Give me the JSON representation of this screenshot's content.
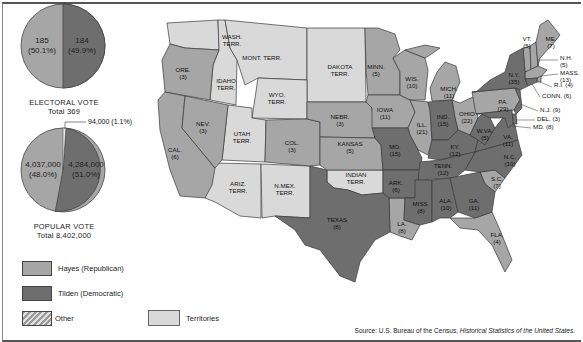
{
  "colors": {
    "hayes": "#a6a6a6",
    "tilden": "#6e6e6e",
    "territories": "#d9d9d9",
    "other": "#bdbdbd",
    "border": "#3a3a3a"
  },
  "electoral": {
    "hayes_value": "185",
    "hayes_pct": "(50.1%)",
    "tilden_value": "184",
    "tilden_pct": "(49.9%)",
    "title": "ELECTORAL VOTE",
    "total": "Total  369"
  },
  "popular": {
    "hayes_value": "4,037,000",
    "hayes_pct": "(48.0%)",
    "tilden_value": "4,284,000",
    "tilden_pct": "(51.0%)",
    "other_callout": "94,000 (1.1%)",
    "title": "POPULAR VOTE",
    "total": "Total  8,402,000"
  },
  "legend": {
    "hayes": "Hayes (Republican)",
    "tilden": "Tilden (Democratic)",
    "other": "Other",
    "territories": "Territories"
  },
  "source": {
    "prefix": "Source: U.S. Bureau of the Census, ",
    "title": "Historical Statistics of the United States."
  },
  "chart_data": [
    {
      "type": "pie",
      "title": "ELECTORAL VOTE",
      "subtitle": "Total 369",
      "categories": [
        "Hayes (Republican)",
        "Tilden (Democratic)"
      ],
      "values": [
        185,
        184
      ],
      "percentages": [
        50.1,
        49.9
      ]
    },
    {
      "type": "pie",
      "title": "POPULAR VOTE",
      "subtitle": "Total 8,402,000",
      "categories": [
        "Hayes (Republican)",
        "Tilden (Democratic)",
        "Other"
      ],
      "values": [
        4037000,
        4284000,
        94000
      ],
      "percentages": [
        48.0,
        51.0,
        1.1
      ]
    }
  ],
  "map": {
    "labels": [
      {
        "id": "wash",
        "line1": "WASH.",
        "line2": "TERR.",
        "x": 232,
        "y": 40
      },
      {
        "id": "mont",
        "line1": "MONT. TERR.",
        "line2": "",
        "x": 262,
        "y": 57
      },
      {
        "id": "dakota",
        "line1": "DAKOTA",
        "line2": "TERR.",
        "x": 340,
        "y": 70
      },
      {
        "id": "minn",
        "line1": "MINN.",
        "line2": "(5)",
        "x": 376,
        "y": 70
      },
      {
        "id": "ore",
        "line1": "ORE.",
        "line2": "(3)",
        "x": 183,
        "y": 73
      },
      {
        "id": "idaho",
        "line1": "IDAHO",
        "line2": "TERR.",
        "x": 226,
        "y": 84
      },
      {
        "id": "wyo",
        "line1": "WYO.",
        "line2": "TERR.",
        "x": 277,
        "y": 98
      },
      {
        "id": "wis",
        "line1": "WIS.",
        "line2": "(10)",
        "x": 412,
        "y": 82
      },
      {
        "id": "mich",
        "line1": "MICH.",
        "line2": "(11)",
        "x": 449,
        "y": 92
      },
      {
        "id": "iowa",
        "line1": "IOWA",
        "line2": "(11)",
        "x": 385,
        "y": 113
      },
      {
        "id": "nebr",
        "line1": "NEBR.",
        "line2": "(3)",
        "x": 340,
        "y": 120
      },
      {
        "id": "nev",
        "line1": "NEV.",
        "line2": "(3)",
        "x": 203,
        "y": 127
      },
      {
        "id": "ill",
        "line1": "ILL.",
        "line2": "(21)",
        "x": 422,
        "y": 128
      },
      {
        "id": "ind",
        "line1": "IND.",
        "line2": "(15)",
        "x": 443,
        "y": 120
      },
      {
        "id": "ohio",
        "line1": "OHIO",
        "line2": "(22)",
        "x": 467,
        "y": 117
      },
      {
        "id": "pa",
        "line1": "PA.",
        "line2": "(29)",
        "x": 503,
        "y": 105
      },
      {
        "id": "ny",
        "line1": "N.Y.",
        "line2": "(35)",
        "x": 514,
        "y": 78
      },
      {
        "id": "utah",
        "line1": "UTAH",
        "line2": "TERR.",
        "x": 242,
        "y": 137
      },
      {
        "id": "col",
        "line1": "COL.",
        "line2": "(3)",
        "x": 292,
        "y": 146
      },
      {
        "id": "kansas",
        "line1": "KANSAS",
        "line2": "(5)",
        "x": 350,
        "y": 147
      },
      {
        "id": "mo",
        "line1": "MO.",
        "line2": "(15)",
        "x": 395,
        "y": 150
      },
      {
        "id": "ky",
        "line1": "KY.",
        "line2": "(12)",
        "x": 455,
        "y": 150
      },
      {
        "id": "wva",
        "line1": "W.VA.",
        "line2": "(5)",
        "x": 485,
        "y": 134
      },
      {
        "id": "va",
        "line1": "VA.",
        "line2": "(11)",
        "x": 508,
        "y": 140
      },
      {
        "id": "cal",
        "line1": "CAL.",
        "line2": "(6)",
        "x": 175,
        "y": 153
      },
      {
        "id": "nc",
        "line1": "N.C.",
        "line2": "(10)",
        "x": 510,
        "y": 160
      },
      {
        "id": "tenn",
        "line1": "TENN.",
        "line2": "(12)",
        "x": 443,
        "y": 169
      },
      {
        "id": "indian",
        "line1": "INDIAN",
        "line2": "TERR.",
        "x": 356,
        "y": 178
      },
      {
        "id": "ark",
        "line1": "ARK.",
        "line2": "(6)",
        "x": 396,
        "y": 186
      },
      {
        "id": "sc",
        "line1": "S.C.",
        "line2": "(7)",
        "x": 497,
        "y": 182
      },
      {
        "id": "ariz",
        "line1": "ARIZ.",
        "line2": "TERR.",
        "x": 238,
        "y": 187
      },
      {
        "id": "nmex",
        "line1": "N.MEX.",
        "line2": "TERR.",
        "x": 285,
        "y": 189
      },
      {
        "id": "miss",
        "line1": "MISS.",
        "line2": "(8)",
        "x": 421,
        "y": 207
      },
      {
        "id": "ala",
        "line1": "ALA.",
        "line2": "(10)",
        "x": 446,
        "y": 204
      },
      {
        "id": "ga",
        "line1": "GA.",
        "line2": "(11)",
        "x": 474,
        "y": 204
      },
      {
        "id": "texas",
        "line1": "TEXAS",
        "line2": "(8)",
        "x": 337,
        "y": 223
      },
      {
        "id": "la",
        "line1": "LA.",
        "line2": "(8)",
        "x": 402,
        "y": 227
      },
      {
        "id": "fla",
        "line1": "FLA.",
        "line2": "(4)",
        "x": 497,
        "y": 238
      },
      {
        "id": "vt",
        "line1": "VT.",
        "line2": "(5)",
        "x": 527,
        "y": 42
      },
      {
        "id": "me",
        "line1": "ME.",
        "line2": "(7)",
        "x": 551,
        "y": 42
      }
    ],
    "callouts": [
      {
        "id": "nh",
        "line1": "N.H.",
        "line2": "(5)",
        "x": 560,
        "y": 58
      },
      {
        "id": "mass",
        "line1": "MASS.",
        "line2": "(13)",
        "x": 560,
        "y": 73
      },
      {
        "id": "ri",
        "text": "R.I. (4)",
        "x": 554,
        "y": 85
      },
      {
        "id": "conn",
        "text": "CONN. (6)",
        "x": 542,
        "y": 96
      },
      {
        "id": "nj",
        "text": "N.J. (9)",
        "x": 540,
        "y": 110
      },
      {
        "id": "del",
        "text": "DEL. (3)",
        "x": 537,
        "y": 119
      },
      {
        "id": "md",
        "text": "MD. (8)",
        "x": 533,
        "y": 127
      }
    ]
  }
}
